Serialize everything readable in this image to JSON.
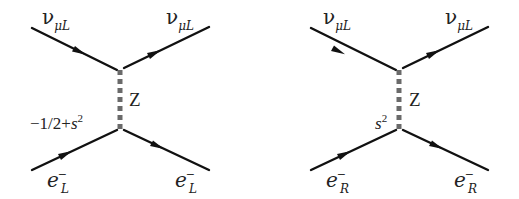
{
  "figure": {
    "colors": {
      "fermion_line": "#111111",
      "boson_line": "#6a6a6a",
      "text": "#222222",
      "background": "#ffffff"
    },
    "diagrams": [
      {
        "id": "left",
        "incoming_top": {
          "base": "ν",
          "sub": "μL"
        },
        "outgoing_top": {
          "base": "ν",
          "sub": "μL"
        },
        "boson": {
          "label": "Z"
        },
        "coupling": {
          "prefix": "−1/2+",
          "var": "s",
          "sup": "2"
        },
        "incoming_bottom": {
          "base": "e",
          "sup": "−",
          "sub": "L"
        },
        "outgoing_bottom": {
          "base": "e",
          "sup": "−",
          "sub": "L"
        }
      },
      {
        "id": "right",
        "incoming_top": {
          "base": "ν",
          "sub": "μL"
        },
        "outgoing_top": {
          "base": "ν",
          "sub": "μL"
        },
        "boson": {
          "label": "Z"
        },
        "coupling": {
          "prefix": "",
          "var": "s",
          "sup": "2"
        },
        "incoming_bottom": {
          "base": "e",
          "sup": "−",
          "sub": "R"
        },
        "outgoing_bottom": {
          "base": "e",
          "sup": "−",
          "sub": "R"
        }
      }
    ]
  }
}
